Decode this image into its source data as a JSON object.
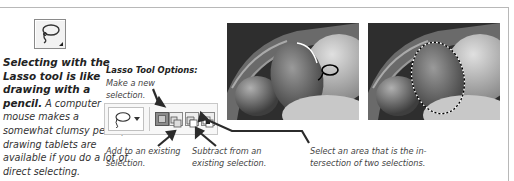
{
  "tool": {
    "name": "Lasso tool",
    "icon": "lasso-icon"
  },
  "caption": {
    "lead": "Selecting with the Lasso tool is like drawing with a pencil.",
    "body": " A computer mouse makes a somewhat clumsy pencil; drawing tablets are available if you do a lot of direct selecting."
  },
  "options": {
    "title": "Lasso Tool Options:",
    "new_selection": "Make a new selection.",
    "add_selection": "Add to an existing selection.",
    "subtract_selection": "Subtract from an existing selection.",
    "intersect_selection": "Select an area that is the in-tersection of two selections."
  },
  "photos": [
    {
      "label": "Lasso drawing in progress"
    },
    {
      "label": "Completed selection with marching ants"
    }
  ],
  "colors": {
    "rule": "#b8b8b8",
    "text": "#333333",
    "arrow": "#2b2b2b"
  }
}
